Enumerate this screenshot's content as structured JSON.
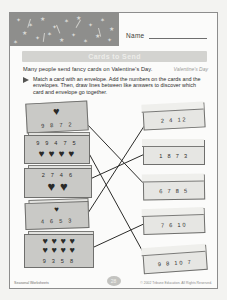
{
  "document": {
    "name_label": "Name",
    "title": "Cards to Send",
    "intro": "Many people send fancy cards on Valentine's Day.",
    "theme_tag": "Valentine's Day",
    "directions": "Match a card with an envelope. Add the numbers on the cards and the envelopes. Then, draw lines between like answers to discover which card and envelope go together.",
    "page_number": "28",
    "footer_left": "Seasonal Worksheets",
    "footer_right": "© 2002 Tribune Education. All Rights Reserved."
  },
  "cards": [
    {
      "id": "card-1",
      "numbers": "9 8 7 2",
      "hearts": 1,
      "heart_rows": 1
    },
    {
      "id": "card-2",
      "numbers": "9 9 4 7 5",
      "hearts": 4,
      "heart_rows": 1
    },
    {
      "id": "card-3",
      "numbers": "2 7 4 6",
      "hearts": 2,
      "heart_rows": 1
    },
    {
      "id": "card-4",
      "numbers": "4 6 5 3",
      "hearts": 1,
      "heart_rows": 1
    },
    {
      "id": "card-5",
      "numbers": "9 3 5 8",
      "hearts": 8,
      "heart_rows": 2
    }
  ],
  "envelopes": [
    {
      "id": "envelope-1",
      "numbers": "2 4 12"
    },
    {
      "id": "envelope-2",
      "numbers": "1 8 7 3"
    },
    {
      "id": "envelope-3",
      "numbers": "6 7 8 5"
    },
    {
      "id": "envelope-4",
      "numbers": "7 6 10"
    },
    {
      "id": "envelope-5",
      "numbers": "9 8 10 7"
    }
  ],
  "heart_glyph": "♥",
  "colors": {
    "banner": "#8e8e8c",
    "title_bar": "#d3d3d0",
    "card_fill": "#c9c9c6",
    "envelope_fill": "#e6e6e3",
    "ink": "#2c2c2c"
  }
}
